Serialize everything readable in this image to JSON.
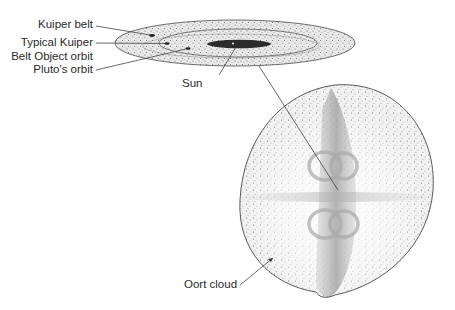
{
  "labels": {
    "kuiper_belt": "Kuiper belt",
    "kbo_orbit_line1": "Typical Kuiper",
    "kbo_orbit_line2": "Belt Object orbit",
    "pluto_orbit": "Pluto's orbit",
    "sun": "Sun",
    "oort_cloud": "Oort cloud"
  },
  "colors": {
    "stipple": "#6a6a6a",
    "outline": "#4a4a4a",
    "inner_disk": "#2b2b2b",
    "leader": "#444444",
    "text": "#2a2a2a"
  }
}
